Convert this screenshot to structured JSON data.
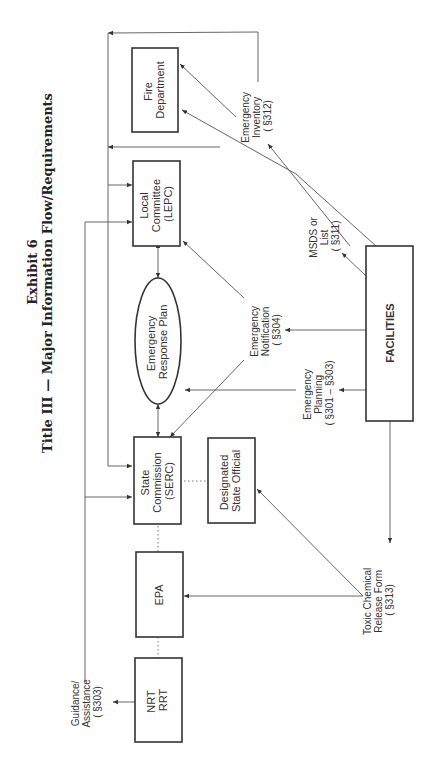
{
  "header": {
    "exhibit": "Exhibit 6",
    "title": "Title III — Major Information Flow/Requirements"
  },
  "nodes": {
    "nrt": [
      "NRT",
      "RRT"
    ],
    "epa": [
      "EPA"
    ],
    "serc": [
      "State",
      "Commission",
      "(SERC)"
    ],
    "designated": [
      "Designated",
      "State Official"
    ],
    "erp": [
      "Emergency",
      "Response Plan"
    ],
    "lepc": [
      "Local",
      "Committee",
      "(LEPC)"
    ],
    "fire": [
      "Fire",
      "Department"
    ],
    "facilities": [
      "FACILITIES"
    ]
  },
  "flows": {
    "guidance": [
      "Guidance/",
      "Assistance",
      "( §303)"
    ],
    "toxic": [
      "Toxic Chemical",
      "Release Form",
      "( §313)"
    ],
    "planning": [
      "Emergency",
      "Planning",
      "( §301 – §303)"
    ],
    "notification": [
      "Emergency",
      "Notification",
      "( §304)"
    ],
    "msds": [
      "MSDS or",
      "List",
      "( §311)"
    ],
    "inventory": [
      "Emergency",
      "Inventory",
      "( §312)"
    ]
  },
  "colors": {
    "line": "#555555",
    "box": "#333333",
    "text": "#333333"
  }
}
